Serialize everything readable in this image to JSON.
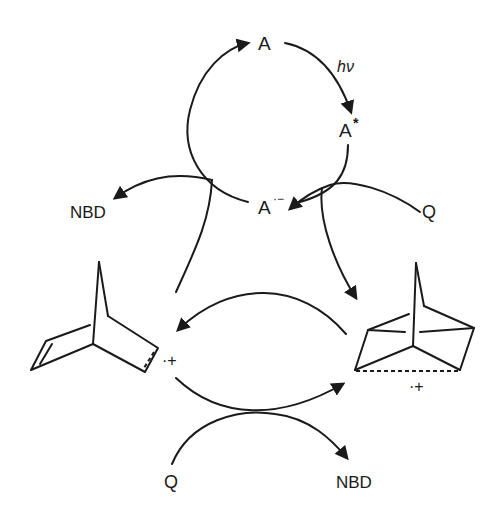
{
  "diagram": {
    "type": "photoinduced electron-transfer catalytic cycle (quadricyclane to norbornadiene)",
    "labels": {
      "sensitizer": "A",
      "light": "hν",
      "excited": "A",
      "excited_sup": "*",
      "radical_anion": "A",
      "radical_anion_sup": "·−",
      "nbd_top": "NBD",
      "q_top": "Q",
      "nbd_radical_cation_charge": "·+",
      "q_radical_cation_charge": "·+",
      "q_bottom": "Q",
      "nbd_bottom": "NBD"
    },
    "nodes": [
      {
        "id": "A",
        "label": "A"
      },
      {
        "id": "A*",
        "label": "A*"
      },
      {
        "id": "A-",
        "label": "A·−"
      },
      {
        "id": "NBD_top",
        "label": "NBD"
      },
      {
        "id": "Q_top",
        "label": "Q"
      },
      {
        "id": "NBD_rc",
        "label": "norbornadiene radical cation (structure)"
      },
      {
        "id": "Q_rc",
        "label": "quadricyclane radical cation (structure)"
      },
      {
        "id": "Q_bottom",
        "label": "Q"
      },
      {
        "id": "NBD_bottom",
        "label": "NBD"
      }
    ],
    "edges": [
      {
        "from": "A",
        "to": "A*",
        "label": "hν"
      },
      {
        "from": "A*",
        "to": "A-"
      },
      {
        "from": "A-",
        "to": "A"
      },
      {
        "from": "Q_top",
        "to": "Q_rc"
      },
      {
        "from": "NBD_rc",
        "to": "NBD_top"
      },
      {
        "from": "Q_rc",
        "to": "NBD_rc"
      },
      {
        "from": "NBD_rc",
        "to": "Q_rc"
      },
      {
        "from": "Q_bottom",
        "to": "NBD_bottom"
      }
    ]
  }
}
